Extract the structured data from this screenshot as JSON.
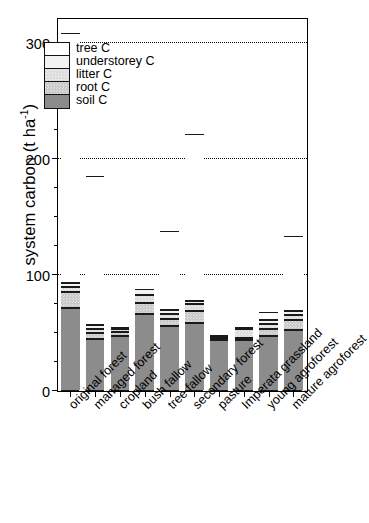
{
  "chart_data": {
    "type": "bar",
    "subtype": "stacked",
    "title": "",
    "xlabel": "",
    "ylabel": "system carbon (t ha⁻¹)",
    "ylabel_main": "system carbon (t ha",
    "ylabel_sup": "-1",
    "ylabel_close": ")",
    "ylim": [
      0,
      320
    ],
    "ytick_labels": [
      "0",
      "100",
      "200",
      "300"
    ],
    "ytick_values": [
      0,
      100,
      200,
      300
    ],
    "yminor_step": 25,
    "grid": "horizontal dotted at 100, 200, 300",
    "legend_position": "inside top-left",
    "categories": [
      "original forest",
      "managed forest",
      "cropland",
      "bush fallow",
      "tree fallow",
      "secondary forest",
      "pasture",
      "Imperata grassland",
      "young agroforest",
      "mature agroforest"
    ],
    "series": [
      {
        "name": "soil C",
        "key": "soil",
        "values": [
          71,
          44,
          47,
          66,
          55,
          58,
          43,
          43,
          47,
          52
        ]
      },
      {
        "name": "root C",
        "key": "root",
        "values": [
          14,
          5,
          3,
          9,
          6,
          10,
          2,
          2,
          6,
          8
        ]
      },
      {
        "name": "litter C",
        "key": "litter",
        "values": [
          4,
          4,
          3,
          7,
          5,
          6,
          1,
          8,
          4,
          5
        ]
      },
      {
        "name": "understorey C",
        "key": "understorey",
        "values": [
          3,
          3,
          1,
          5,
          3,
          3,
          1,
          1,
          3,
          3
        ]
      },
      {
        "name": "tree C",
        "key": "tree",
        "values": [
          216,
          129,
          0,
          0,
          68,
          144,
          0,
          0,
          7,
          65
        ]
      }
    ],
    "totals": [
      308,
      185,
      54,
      87,
      137,
      221,
      47,
      54,
      67,
      133
    ]
  },
  "legend": {
    "entries": [
      {
        "label": "tree C",
        "key": "tree"
      },
      {
        "label": "understorey C",
        "key": "understorey"
      },
      {
        "label": "litter C",
        "key": "litter"
      },
      {
        "label": "root C",
        "key": "root"
      },
      {
        "label": "soil C",
        "key": "soil"
      }
    ]
  },
  "colors": {
    "tree": "#ffffff",
    "understorey": "#f2f2f2",
    "litter": "#e6e6e6",
    "root": "#c9c9c9",
    "soil": "#8c8c8c",
    "axis": "#000000"
  }
}
